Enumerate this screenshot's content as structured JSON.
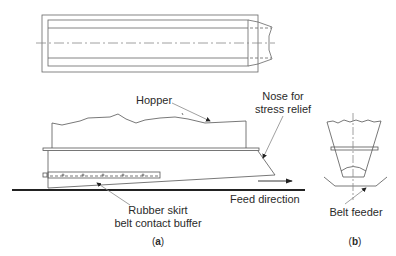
{
  "figure": {
    "view_a": {
      "caption": "(a)",
      "caption_letter": "a",
      "labels": {
        "hopper": "Hopper",
        "nose_line1": "Nose for",
        "nose_line2": "stress relief",
        "feed": "Feed direction",
        "skirt_line1": "Rubber skirt",
        "skirt_line2": "belt contact buffer"
      }
    },
    "view_b": {
      "caption": "(b)",
      "caption_letter": "b",
      "labels": {
        "belt_feeder": "Belt feeder"
      }
    },
    "colors": {
      "line": "#555555",
      "belt": "#222222",
      "leader": "#888888",
      "text": "#2a2a2a"
    }
  }
}
